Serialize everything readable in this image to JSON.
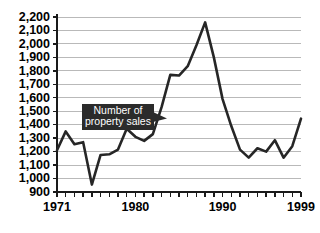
{
  "chart_data": {
    "type": "line",
    "title": "",
    "subtitle": "",
    "xlabel": "",
    "ylabel": "",
    "xlim": [
      1971,
      1999
    ],
    "ylim": [
      900,
      2200
    ],
    "ytick_step": 100,
    "grid": true,
    "legend": "none",
    "x_tick_labels": [
      "1971",
      "1980",
      "1990",
      "1999"
    ],
    "x_labeled_years": [
      1971,
      1980,
      1990,
      1999
    ],
    "y_tick_labels": [
      "2,200",
      "2,100",
      "2,000",
      "1,900",
      "1,800",
      "1,700",
      "1,600",
      "1,500",
      "1,400",
      "1,300",
      "1,200",
      "1,100",
      "1,000",
      "900"
    ],
    "y_tick_values": [
      2200,
      2100,
      2000,
      1900,
      1800,
      1700,
      1600,
      1500,
      1400,
      1300,
      1200,
      1100,
      1000,
      900
    ],
    "series": [
      {
        "name": "Number of property sales",
        "x": [
          1971,
          1972,
          1973,
          1974,
          1975,
          1976,
          1977,
          1978,
          1979,
          1980,
          1981,
          1982,
          1983,
          1984,
          1985,
          1986,
          1987,
          1988,
          1989,
          1990,
          1991,
          1992,
          1993,
          1994,
          1995,
          1996,
          1997,
          1998,
          1999
        ],
        "values": [
          1210,
          1350,
          1255,
          1270,
          955,
          1175,
          1180,
          1215,
          1370,
          1310,
          1280,
          1330,
          1530,
          1770,
          1765,
          1835,
          1990,
          2160,
          1900,
          1590,
          1390,
          1215,
          1155,
          1225,
          1200,
          1285,
          1155,
          1240,
          1445
        ]
      }
    ],
    "annotations": [
      {
        "label_line1": "Number of",
        "label_line2": "property sales",
        "points_to_year": 1983,
        "style": "dark-callout-with-arrow"
      }
    ],
    "colors": {
      "line": "#262626",
      "gridline": "#b9b9b9",
      "axis": "#1a1a1a",
      "callout_background": "#2b2b2b",
      "callout_text": "#ffffff",
      "plot_background": "#ffffff"
    }
  }
}
